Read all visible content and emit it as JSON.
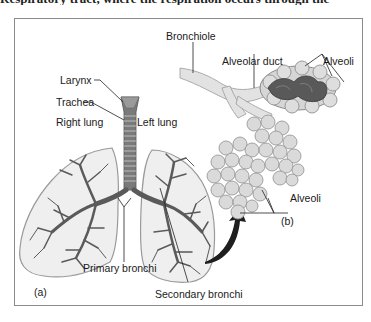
{
  "caption_fragment": "Respiratory tract, where the respiration occurs through the",
  "panel_a": {
    "tag": "(a)",
    "labels": {
      "larynx": "Larynx",
      "trachea": "Trachea",
      "right_lung": "Right lung",
      "left_lung": "Left lung",
      "primary_bronchi": "Primary bronchi",
      "secondary_bronchi": "Secondary bronchi"
    }
  },
  "panel_b": {
    "tag": "(b)",
    "labels": {
      "bronchiole": "Bronchiole",
      "alveolar_duct": "Alveolar duct",
      "alveoli_top": "Alveoli",
      "alveoli_bottom": "Alveoli"
    }
  },
  "colors": {
    "frame": "#8a8a8a",
    "lung_fill": "#eeeeee",
    "lung_outline": "#9a9a9a",
    "bronchi": "#5a5a5a",
    "alveoli_fill": "#d8d8d8",
    "duct_dark": "#555555",
    "arrow": "#1f1f1f"
  }
}
